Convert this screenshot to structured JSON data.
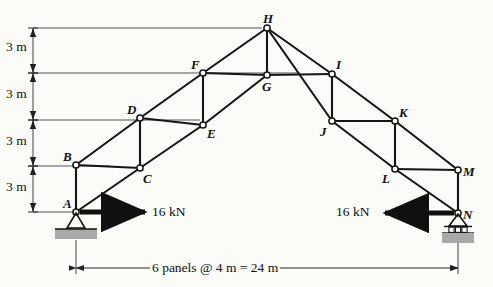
{
  "figure": {
    "type": "truss-diagram"
  },
  "joints": [
    {
      "id": "A",
      "x": 76,
      "y": 212,
      "label": "A",
      "label_dx": -13,
      "label_dy": -15
    },
    {
      "id": "B",
      "x": 76,
      "y": 165,
      "label": "B",
      "label_dx": -13,
      "label_dy": -15
    },
    {
      "id": "C",
      "x": 140,
      "y": 168,
      "label": "C",
      "label_dx": 3,
      "label_dy": 4
    },
    {
      "id": "D",
      "x": 140,
      "y": 118,
      "label": "D",
      "label_dx": -13,
      "label_dy": -15
    },
    {
      "id": "E",
      "x": 203,
      "y": 125,
      "label": "E",
      "label_dx": 4,
      "label_dy": 2
    },
    {
      "id": "F",
      "x": 203,
      "y": 73,
      "label": "F",
      "label_dx": -12,
      "label_dy": -15
    },
    {
      "id": "G",
      "x": 267,
      "y": 75,
      "label": "G",
      "label_dx": -5,
      "label_dy": 5
    },
    {
      "id": "H",
      "x": 267,
      "y": 28,
      "label": "H",
      "label_dx": -4,
      "label_dy": -16
    },
    {
      "id": "I",
      "x": 332,
      "y": 74,
      "label": "I",
      "label_dx": 4,
      "label_dy": -16
    },
    {
      "id": "J",
      "x": 332,
      "y": 121,
      "label": "J",
      "label_dx": -12,
      "label_dy": 4
    },
    {
      "id": "K",
      "x": 395,
      "y": 121,
      "label": "K",
      "label_dx": 4,
      "label_dy": -15
    },
    {
      "id": "L",
      "x": 395,
      "y": 169,
      "label": "L",
      "label_dx": -13,
      "label_dy": 3
    },
    {
      "id": "M",
      "x": 458,
      "y": 170,
      "label": "M",
      "label_dx": 5,
      "label_dy": -5
    },
    {
      "id": "N",
      "x": 458,
      "y": 213,
      "label": "N",
      "label_dx": 5,
      "label_dy": -5
    }
  ],
  "members": [
    [
      "A",
      "C"
    ],
    [
      "C",
      "E"
    ],
    [
      "E",
      "G"
    ],
    [
      "G",
      "H"
    ],
    [
      "H",
      "I"
    ],
    [
      "I",
      "K"
    ],
    [
      "K",
      "M"
    ],
    [
      "M",
      "N"
    ],
    [
      "A",
      "B"
    ],
    [
      "B",
      "D"
    ],
    [
      "D",
      "F"
    ],
    [
      "F",
      "H"
    ],
    [
      "H",
      "J"
    ],
    [
      "J",
      "L"
    ],
    [
      "L",
      "N"
    ],
    [
      "B",
      "C"
    ],
    [
      "D",
      "E"
    ],
    [
      "F",
      "G"
    ],
    [
      "G",
      "I"
    ],
    [
      "J",
      "K"
    ],
    [
      "L",
      "M"
    ],
    [
      "C",
      "D"
    ],
    [
      "E",
      "F"
    ],
    [
      "I",
      "J"
    ],
    [
      "K",
      "L"
    ]
  ],
  "supports": [
    {
      "at": "A",
      "kind": "pin",
      "name": "pin-support"
    },
    {
      "at": "N",
      "kind": "roller",
      "name": "roller-support"
    }
  ],
  "loads": [
    {
      "at": "A",
      "label": "16 kN",
      "direction": "right",
      "x1": 80,
      "x2": 145,
      "y": 212,
      "text_x": 152,
      "text_y": 205
    },
    {
      "at": "N",
      "label": "16 kN",
      "direction": "left",
      "x1": 454,
      "x2": 385,
      "y": 213,
      "text_x": 336,
      "text_y": 205
    }
  ],
  "vertical_dimensions": {
    "axis_x": 33,
    "labels": [
      {
        "text": "3 m",
        "y_top": 28,
        "y_bot": 73,
        "text_x": 6,
        "text_y": 40
      },
      {
        "text": "3 m",
        "y_top": 73,
        "y_bot": 120,
        "text_x": 6,
        "text_y": 87
      },
      {
        "text": "3 m",
        "y_top": 120,
        "y_bot": 166,
        "text_x": 6,
        "text_y": 134
      },
      {
        "text": "3 m",
        "y_top": 166,
        "y_bot": 212,
        "text_x": 6,
        "text_y": 180
      }
    ]
  },
  "extension_lines": [
    {
      "y": 28,
      "x1": 33,
      "x2": 262
    },
    {
      "y": 73,
      "x1": 33,
      "x2": 300
    },
    {
      "y": 120,
      "x1": 33,
      "x2": 200
    },
    {
      "y": 166,
      "x1": 33,
      "x2": 110
    },
    {
      "y": 212,
      "x1": 33,
      "x2": 74
    }
  ],
  "span_dimension": {
    "text": "6 panels @ 4 m = 24 m",
    "y": 268,
    "x1": 76,
    "x2": 458,
    "text_x": 150,
    "text_y": 261
  },
  "colors": {
    "line": "#151515",
    "ground_hatch": "#a9a9a9",
    "background": "#fbfbf7",
    "dimension_line": "#2a2a2a"
  }
}
